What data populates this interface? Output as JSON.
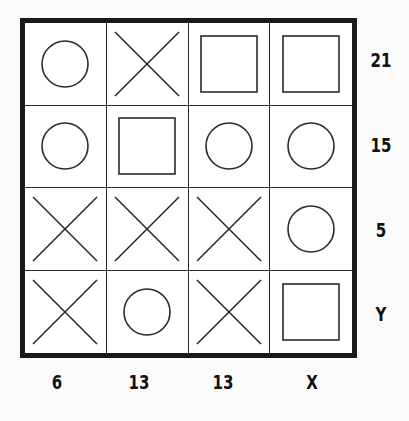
{
  "puzzle": {
    "rows": [
      {
        "cells": [
          "circle",
          "cross",
          "square",
          "square"
        ],
        "sum": "21"
      },
      {
        "cells": [
          "circle",
          "square",
          "circle",
          "circle"
        ],
        "sum": "15"
      },
      {
        "cells": [
          "cross",
          "cross",
          "cross",
          "circle"
        ],
        "sum": "5"
      },
      {
        "cells": [
          "cross",
          "circle",
          "cross",
          "square"
        ],
        "sum": "Y"
      }
    ],
    "column_sums": [
      "6",
      "13",
      "13",
      "X"
    ]
  },
  "colors": {
    "line": "#2a2a2a",
    "border": "#1a1a1a",
    "text": "#111111"
  }
}
